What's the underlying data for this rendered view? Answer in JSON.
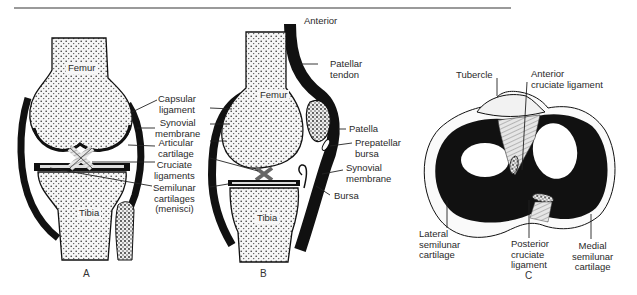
{
  "figure": {
    "panels": [
      {
        "id": "A",
        "label": "A",
        "view": "frontal section of knee joint"
      },
      {
        "id": "B",
        "label": "B",
        "view": "sagittal section of knee joint"
      },
      {
        "id": "C",
        "label": "C",
        "view": "superior view of tibial plateau"
      }
    ]
  },
  "panelA": {
    "bone_femur": "Femur",
    "bone_tibia": "Tibia",
    "caption": "A"
  },
  "center_labels": {
    "capsular_ligament": "Capsular\nligament",
    "synovial_membrane": "Synovial\nmembrane",
    "articular_cartilage": "Articular\ncartilage",
    "cruciate_ligaments": "Cruciate\nligaments",
    "semilunar_cartilages": "Semilunar\ncartilages\n(menisci)"
  },
  "panelB": {
    "bone_femur": "Femur",
    "bone_tibia": "Tibia",
    "anterior": "Anterior",
    "patellar_tendon": "Patellar\ntendon",
    "patella": "Patella",
    "prepatellar_bursa": "Prepatellar\nbursa",
    "synovial_membrane": "Synovial\nmembrane",
    "bursa": "Bursa",
    "caption": "B"
  },
  "panelC": {
    "tubercle": "Tubercle",
    "anterior_cruciate": "Anterior\ncruciate ligament",
    "lateral_semilunar": "Lateral\nsemilunar\ncartilage",
    "posterior_cruciate": "Posterior\ncruciate\nligament",
    "medial_semilunar": "Medial\nsemilunar\ncartilage",
    "caption": "C"
  },
  "colors": {
    "ink": "#111111",
    "bone_fill": "#f4f4f4",
    "rule": "#8a8a8a",
    "text": "#2a2a2a"
  }
}
